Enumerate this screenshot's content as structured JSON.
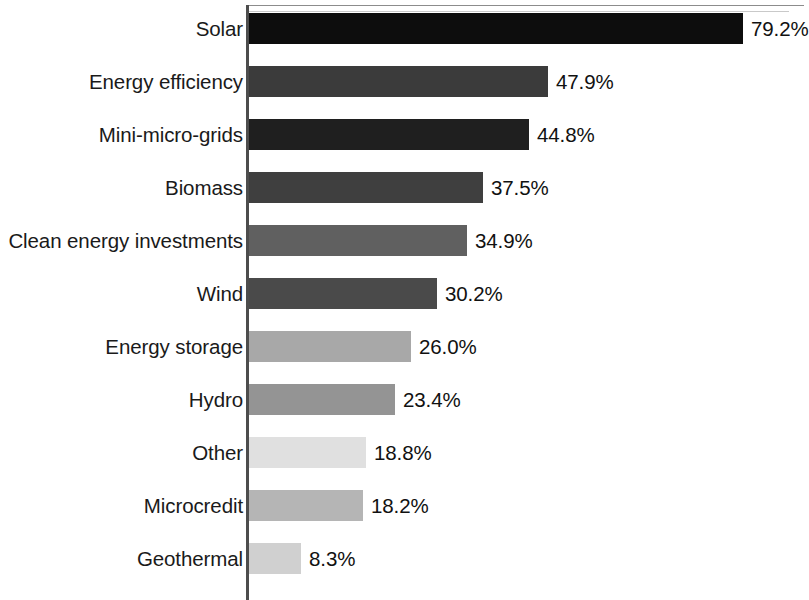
{
  "chart_data": {
    "type": "bar",
    "orientation": "horizontal",
    "title": "",
    "subtitle": "",
    "xlabel": "",
    "ylabel": "",
    "grid": false,
    "legend": false,
    "legend_position": "none",
    "xlim": [
      0,
      79.2
    ],
    "value_suffix": "%",
    "categories": [
      "Solar",
      "Energy efficiency",
      "Mini-micro-grids",
      "Biomass",
      "Clean energy investments",
      "Wind",
      "Energy storage",
      "Hydro",
      "Other",
      "Microcredit",
      "Geothermal"
    ],
    "values": [
      79.2,
      47.9,
      44.8,
      37.5,
      34.9,
      30.2,
      26.0,
      23.4,
      18.8,
      18.2,
      8.3
    ],
    "value_labels": [
      "79.2%",
      "47.9%",
      "44.8%",
      "37.5%",
      "34.9%",
      "30.2%",
      "26.0%",
      "23.4%",
      "18.8%",
      "18.2%",
      "8.3%"
    ],
    "bar_colors": [
      "#0d0d0d",
      "#3b3b3b",
      "#1f1f1f",
      "#3f3f3f",
      "#606060",
      "#4a4a4a",
      "#a8a8a8",
      "#949494",
      "#e0e0e0",
      "#b5b5b5",
      "#d0d0d0"
    ],
    "axis_color": "#4d4d4d"
  }
}
